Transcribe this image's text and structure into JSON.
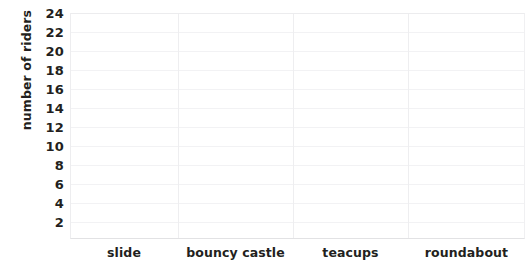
{
  "chart_data": {
    "type": "bar",
    "title": "",
    "subtitle": "",
    "xlabel": "",
    "ylabel": "number of riders",
    "categories": [
      "slide",
      "bouncy castle",
      "teacups",
      "roundabout"
    ],
    "values": [
      null,
      null,
      null,
      null
    ],
    "series": [
      {
        "name": "number of riders",
        "values": [
          null,
          null,
          null,
          null
        ]
      }
    ],
    "ylim": [
      0,
      25
    ],
    "y_ticks": [
      2,
      4,
      6,
      8,
      10,
      12,
      14,
      16,
      18,
      20,
      22,
      24
    ],
    "y_tick_labels": [
      "2",
      "4",
      "6",
      "8",
      "10",
      "12",
      "14",
      "16",
      "18",
      "20",
      "22",
      "24"
    ],
    "y_tick_step": 2,
    "grid": {
      "horizontal": true,
      "vertical": true,
      "color": "#f2f2f4"
    },
    "legend": {
      "visible": false,
      "position": "none",
      "entries": []
    },
    "annotations": []
  },
  "axes": {
    "y_title": "number of riders",
    "y_labels": [
      "24",
      "22",
      "20",
      "18",
      "16",
      "14",
      "12",
      "10",
      "8",
      "6",
      "4",
      "2"
    ],
    "x_labels": [
      "slide",
      "bouncy castle",
      "teacups",
      "roundabout"
    ]
  },
  "colors": {
    "background": "#ffffff",
    "text": "#231f20",
    "gridline": "#f2f2f4",
    "axis_line": "#e2e2e4"
  }
}
